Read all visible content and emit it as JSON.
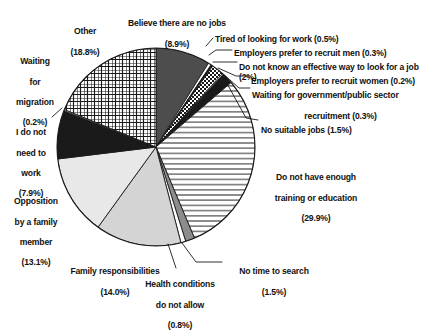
{
  "chart_data": {
    "type": "pie",
    "title": "",
    "subtitle": "",
    "xlabel": "",
    "ylabel": "",
    "legend_position": "callout-labels",
    "grid": false,
    "units": "percent",
    "total": 100,
    "categories": [
      "Believe there are no jobs",
      "Tired of looking for work",
      "Employers prefer to recruit men",
      "Do not know an effective way to look for a job",
      "Employers prefer to recruit women",
      "Waiting for government/public sector recruitment",
      "No suitable jobs",
      "Do not have enough training or education",
      "No time to search",
      "Health conditions do not allow",
      "Family responsibilities",
      "Opposition by a family member",
      "I do not need to work",
      "Waiting for migration",
      "Other"
    ],
    "values": [
      8.9,
      0.5,
      0.3,
      2.0,
      0.2,
      0.3,
      1.5,
      29.9,
      1.5,
      0.8,
      14.0,
      13.1,
      7.9,
      0.2,
      18.8
    ],
    "slices": [
      {
        "name": "Believe there are no jobs",
        "value": 8.9,
        "value_text": "(8.9%)",
        "fill": "#4d4d4d",
        "pattern": "solid-darkgray"
      },
      {
        "name": "Tired of looking for work",
        "value": 0.5,
        "value_text": "(0.5%)",
        "fill": "#ffffff",
        "pattern": "solid-white"
      },
      {
        "name": "Employers prefer to recruit men",
        "value": 0.3,
        "value_text": "(0.3%)",
        "fill": "#1a1a1a",
        "pattern": "solid-black"
      },
      {
        "name": "Do not know an effective way to look for a job",
        "value": 2.0,
        "value_text": "(2%)",
        "fill": "#ffffff",
        "pattern": "checker"
      },
      {
        "name": "Employers prefer to recruit women",
        "value": 0.2,
        "value_text": "(0.2%)",
        "fill": "#ffffff",
        "pattern": "solid-white"
      },
      {
        "name": "Waiting for government/public sector recruitment",
        "value": 0.3,
        "value_text": "(0.3%)",
        "fill": "#1a1a1a",
        "pattern": "solid-black"
      },
      {
        "name": "No suitable jobs",
        "value": 1.5,
        "value_text": "(1.5%)",
        "fill": "#1a1a1a",
        "pattern": "solid-black"
      },
      {
        "name": "Do not have enough training or education",
        "value": 29.9,
        "value_text": "(29.9%)",
        "fill": "#ffffff",
        "pattern": "horizontal-lines"
      },
      {
        "name": "No time to search",
        "value": 1.5,
        "value_text": "(1.5%)",
        "fill": "#8c8c8c",
        "pattern": "solid-midgray"
      },
      {
        "name": "Health conditions do not allow",
        "value": 0.8,
        "value_text": "(0.8%)",
        "fill": "#ffffff",
        "pattern": "solid-white"
      },
      {
        "name": "Family responsibilities",
        "value": 14.0,
        "value_text": "(14.0%)",
        "fill": "#d4d4d4",
        "pattern": "solid-lightgray"
      },
      {
        "name": "Opposition by a family member",
        "value": 13.1,
        "value_text": "(13.1%)",
        "fill": "#e8e8e8",
        "pattern": "solid-paleGray"
      },
      {
        "name": "I do not need to work",
        "value": 7.9,
        "value_text": "(7.9%)",
        "fill": "#1a1a1a",
        "pattern": "solid-black"
      },
      {
        "name": "Waiting for migration",
        "value": 0.2,
        "value_text": "(0.2%)",
        "fill": "#ffffff",
        "pattern": "solid-white"
      },
      {
        "name": "Other",
        "value": 18.8,
        "value_text": "(18.8%)",
        "fill": "#ffffff",
        "pattern": "crosshatch"
      }
    ],
    "colors": {
      "stroke": "#1a1a1a",
      "text": "#111111",
      "background": "#ffffff",
      "dark_gray": "#4d4d4d",
      "mid_gray": "#8c8c8c",
      "light_gray": "#d4d4d4",
      "pale_gray": "#e8e8e8",
      "black": "#1a1a1a"
    }
  },
  "labels": {
    "believe_no_jobs": {
      "line1": "Believe there are no jobs",
      "line2": "(8.9%)"
    },
    "tired_looking": {
      "text": "Tired of looking for work (0.5%)"
    },
    "prefer_men": {
      "text": "Employers prefer to recruit men (0.3%)"
    },
    "no_effective_way": {
      "text": "Do not know an effective way to look for a job (2%)"
    },
    "prefer_women": {
      "text": "Employers prefer to recruit women (0.2%)"
    },
    "waiting_government": {
      "line1": "Waiting for government/public sector",
      "line2": "recruitment (0.3%)"
    },
    "no_suitable_jobs": {
      "text": "No suitable jobs (1.5%)"
    },
    "not_enough_training": {
      "line1": "Do not have enough",
      "line2": "training or education",
      "line3": "(29.9%)"
    },
    "no_time_to_search": {
      "line1": "No time to search",
      "line2": "(1.5%)"
    },
    "health_conditions": {
      "line1": "Health conditions",
      "line2": "do not allow",
      "line3": "(0.8%)"
    },
    "family_responsibilities": {
      "line1": "Family responsibilities",
      "line2": "(14.0%)"
    },
    "opposition_family": {
      "line1": "Opposition",
      "line2": "by a family",
      "line3": "member",
      "line4": "(13.1%)"
    },
    "do_not_need_work": {
      "line1": "I do not",
      "line2": "need to",
      "line3": "work",
      "line4": "(7.9%)"
    },
    "waiting_migration": {
      "line1": "Waiting",
      "line2": "for",
      "line3": "migration",
      "line4": "(0.2%)"
    },
    "other": {
      "line1": "Other",
      "line2": "(18.8%)"
    }
  }
}
